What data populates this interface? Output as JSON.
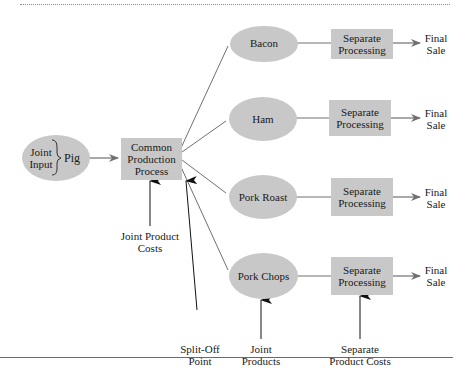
{
  "diagram": {
    "input": {
      "joint_input_line1": "Joint",
      "joint_input_line2": "Input",
      "pig": "Pig"
    },
    "common_process": {
      "line1": "Common",
      "line2": "Production",
      "line3": "Process"
    },
    "products": [
      {
        "name": "Bacon",
        "process_line1": "Separate",
        "process_line2": "Processing",
        "sale_line1": "Final",
        "sale_line2": "Sale"
      },
      {
        "name": "Ham",
        "process_line1": "Separate",
        "process_line2": "Processing",
        "sale_line1": "Final",
        "sale_line2": "Sale"
      },
      {
        "name": "Pork Roast",
        "process_line1": "Separate",
        "process_line2": "Processing",
        "sale_line1": "Final",
        "sale_line2": "Sale"
      },
      {
        "name": "Pork Chops",
        "process_line1": "Separate",
        "process_line2": "Processing",
        "sale_line1": "Final",
        "sale_line2": "Sale"
      }
    ],
    "annotations": {
      "joint_product_costs_line1": "Joint Product",
      "joint_product_costs_line2": "Costs",
      "split_off_line1": "Split-Off",
      "split_off_line2": "Point",
      "joint_products_line1": "Joint",
      "joint_products_line2": "Products",
      "separate_costs_line1": "Separate",
      "separate_costs_line2": "Product Costs"
    },
    "colors": {
      "shape_fill": "#c8c8c8",
      "line": "#707070",
      "arrow_black": "#111111"
    }
  }
}
